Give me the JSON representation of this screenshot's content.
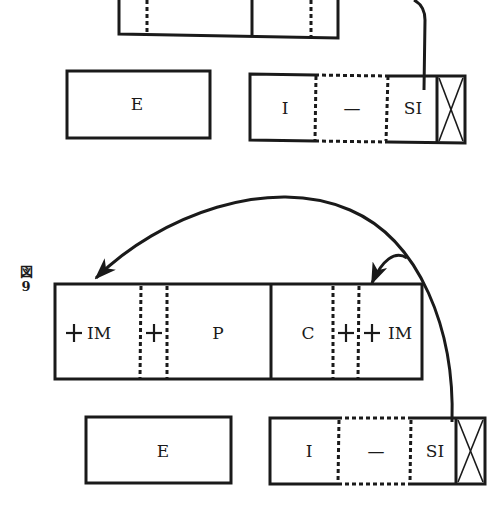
{
  "figure": {
    "label_kanji": "図",
    "label_number": "9"
  },
  "top_section": {
    "partial_bar": {},
    "e_box": {
      "label": "E"
    },
    "i_box": {
      "cells": [
        "I",
        "—",
        "SI"
      ]
    }
  },
  "middle_bar": {
    "left_cell": {
      "plus": "+",
      "label": "IM"
    },
    "mid_cell": {
      "label": "+"
    },
    "p_cell": {
      "label": "P"
    },
    "c_cell": {
      "label": "C"
    },
    "c_plus_cell": {
      "label": "+"
    },
    "right_cell": {
      "plus": "+",
      "label": "IM"
    }
  },
  "bottom_section": {
    "e_box": {
      "label": "E"
    },
    "i_box": {
      "cells": [
        "I",
        "—",
        "SI"
      ]
    }
  },
  "colors": {
    "ink": "#1a1a1a",
    "paper": "#ffffff"
  }
}
